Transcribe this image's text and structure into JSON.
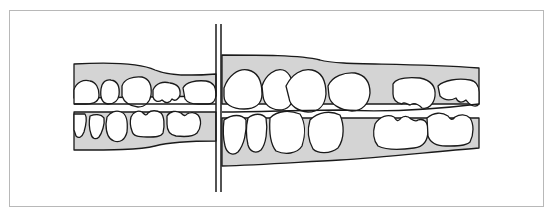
{
  "figure": {
    "type": "dental-occlusion-diagram",
    "colors": {
      "gum": "#d4d4d4",
      "tooth": "#ffffff",
      "outline": "#1a1a1a",
      "frame": "#b8b8b8"
    },
    "left_segment": {
      "upper_teeth": 5,
      "lower_teeth": 6
    },
    "right_segment": {
      "upper_teeth": 6,
      "lower_teeth": 6
    }
  }
}
